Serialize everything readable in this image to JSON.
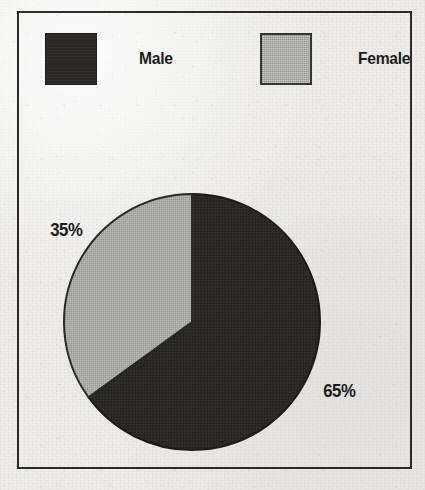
{
  "chart_data": {
    "type": "pie",
    "title": "",
    "categories": [
      "Male",
      "Female"
    ],
    "values": [
      65,
      35
    ],
    "value_unit": "%",
    "data_labels": [
      "65%",
      "35%"
    ],
    "legend": {
      "position": "top",
      "entries": [
        {
          "label": "Male",
          "color": "#2a2927",
          "swatch": "dark-swatch"
        },
        {
          "label": "Female",
          "color": "#a9a9a7",
          "swatch": "gray-swatch"
        }
      ]
    },
    "start_angle_deg": 0,
    "direction": "clockwise",
    "slices": [
      {
        "name": "Male",
        "value": 65,
        "label": "65%",
        "color": "#2a2927",
        "sweep_deg": 234
      },
      {
        "name": "Female",
        "value": 35,
        "label": "35%",
        "color": "#a9a9a7",
        "sweep_deg": 126
      }
    ]
  },
  "legend": {
    "male": {
      "label": "Male"
    },
    "female": {
      "label": "Female"
    }
  },
  "labels": {
    "male_pct": "65%",
    "female_pct": "35%"
  },
  "colors": {
    "male_fill": "#2a2927",
    "female_fill": "#a9a9a7",
    "outline": "#222120",
    "frame": "#2c2b29",
    "paper": "#edecea"
  }
}
